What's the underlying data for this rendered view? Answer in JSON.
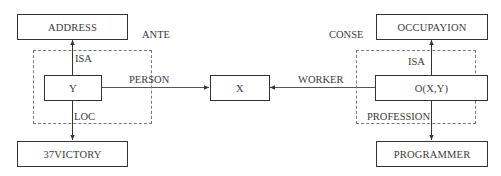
{
  "diagram": {
    "nodes": {
      "address": "ADDRESS",
      "y": "Y",
      "victory": "37VICTORY",
      "x": "X",
      "occupation": "OCCUPAYION",
      "o": "O(X,Y)",
      "programmer": "PROGRAMMER"
    },
    "groups": {
      "ante": "ANTE",
      "conse": "CONSE"
    },
    "edges": {
      "isa_left": "ISA",
      "loc": "LOC",
      "person": "PERSON",
      "worker": "WORKER",
      "isa_right": "ISA",
      "profession": "PROFESSION"
    }
  }
}
